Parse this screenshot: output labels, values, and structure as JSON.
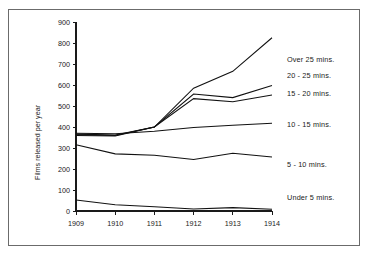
{
  "chart_data": {
    "type": "line",
    "title": "",
    "xlabel": "",
    "ylabel": "Films released per year",
    "categories": [
      "1909",
      "1910",
      "1911",
      "1912",
      "1913",
      "1914"
    ],
    "x": [
      1909,
      1910,
      1911,
      1912,
      1913,
      1914
    ],
    "xlim": [
      1909,
      1914
    ],
    "ylim": [
      0,
      900
    ],
    "ytick_values": [
      0,
      100,
      200,
      300,
      400,
      500,
      600,
      700,
      800,
      900
    ],
    "ytick_labels": [
      "0",
      "100",
      "200",
      "300",
      "400",
      "500",
      "600",
      "700",
      "800",
      "900"
    ],
    "xtick_labels": [
      "1909",
      "1910",
      "1911",
      "1912",
      "1913",
      "1914"
    ],
    "grid": false,
    "legend_position": "right-inline",
    "series": [
      {
        "name": "Over 25 mins.",
        "values": [
          360,
          357,
          400,
          585,
          665,
          825
        ]
      },
      {
        "name": "20 - 25 mins.",
        "values": [
          363,
          360,
          400,
          557,
          540,
          598
        ]
      },
      {
        "name": "15 - 20 mins.",
        "values": [
          366,
          362,
          400,
          535,
          520,
          552
        ]
      },
      {
        "name": "10 - 15 mins.",
        "values": [
          370,
          368,
          380,
          398,
          408,
          418
        ]
      },
      {
        "name": "5 - 10 mins.",
        "values": [
          315,
          272,
          265,
          245,
          275,
          257
        ]
      },
      {
        "name": "Under 5 mins.",
        "values": [
          52,
          30,
          20,
          10,
          16,
          8
        ]
      }
    ]
  },
  "legend": {
    "items": [
      {
        "label": "Over 25 mins."
      },
      {
        "label": "20 - 25 mins."
      },
      {
        "label": "15 - 20 mins."
      },
      {
        "label": "10 - 15 mins."
      },
      {
        "label": "5 - 10 mins."
      },
      {
        "label": "Under 5 mins."
      }
    ]
  },
  "axes": {
    "y_title": "Films released per year"
  },
  "colors": {
    "line": "#111111",
    "axis": "#1a1a1a",
    "frame": "#6b6b6b",
    "background": "#ffffff"
  }
}
